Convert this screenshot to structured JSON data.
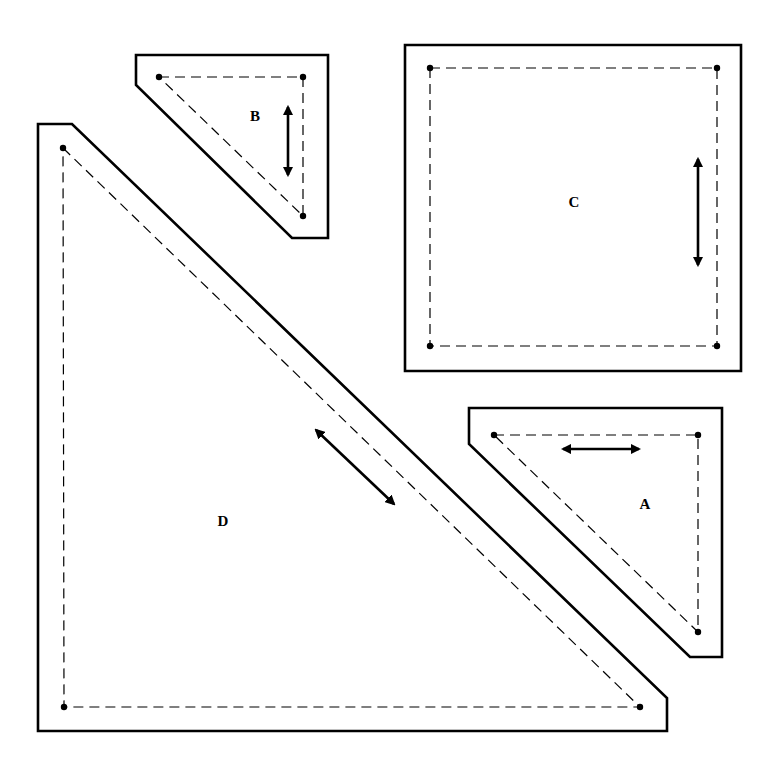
{
  "diagram": {
    "pieces": [
      {
        "id": "A",
        "label": "A",
        "shape": "right triangle",
        "outer": [
          [
            469,
            408
          ],
          [
            722,
            408
          ],
          [
            722,
            657
          ],
          [
            690,
            657
          ],
          [
            469,
            444
          ]
        ],
        "seam": [
          [
            494,
            435
          ],
          [
            698,
            435
          ],
          [
            698,
            632
          ]
        ],
        "dots": [
          [
            494,
            435
          ],
          [
            698,
            435
          ],
          [
            698,
            632
          ]
        ],
        "grain_arrow": [
          [
            563,
            449
          ],
          [
            639,
            449
          ]
        ],
        "label_pos": [
          645,
          509
        ]
      },
      {
        "id": "B",
        "label": "B",
        "shape": "right triangle",
        "outer": [
          [
            136,
            55
          ],
          [
            328,
            55
          ],
          [
            328,
            238
          ],
          [
            292,
            238
          ],
          [
            136,
            85
          ]
        ],
        "seam": [
          [
            159,
            77
          ],
          [
            303,
            77
          ],
          [
            303,
            216
          ]
        ],
        "dots": [
          [
            159,
            77
          ],
          [
            303,
            77
          ],
          [
            303,
            216
          ]
        ],
        "grain_arrow": [
          [
            288,
            107
          ],
          [
            288,
            175
          ]
        ],
        "label_pos": [
          255,
          121
        ]
      },
      {
        "id": "C",
        "label": "C",
        "shape": "square",
        "outer": [
          [
            405,
            45
          ],
          [
            741,
            45
          ],
          [
            741,
            371
          ],
          [
            405,
            371
          ]
        ],
        "seam": [
          [
            430,
            68
          ],
          [
            717,
            68
          ],
          [
            717,
            346
          ],
          [
            430,
            346
          ]
        ],
        "dots": [
          [
            430,
            68
          ],
          [
            717,
            68
          ],
          [
            717,
            346
          ],
          [
            430,
            346
          ]
        ],
        "grain_arrow": [
          [
            698,
            159
          ],
          [
            698,
            265
          ]
        ],
        "label_pos": [
          574,
          207
        ]
      },
      {
        "id": "D",
        "label": "D",
        "shape": "right triangle",
        "outer": [
          [
            38,
            124
          ],
          [
            72,
            124
          ],
          [
            667,
            698
          ],
          [
            667,
            731
          ],
          [
            38,
            731
          ]
        ],
        "seam": [
          [
            63,
            148
          ],
          [
            640,
            707
          ],
          [
            64,
            707
          ]
        ],
        "dots": [
          [
            63,
            148
          ],
          [
            640,
            707
          ],
          [
            64,
            707
          ]
        ],
        "grain_arrow": [
          [
            316,
            430
          ],
          [
            394,
            504
          ]
        ],
        "label_pos": [
          223,
          526
        ]
      }
    ]
  }
}
